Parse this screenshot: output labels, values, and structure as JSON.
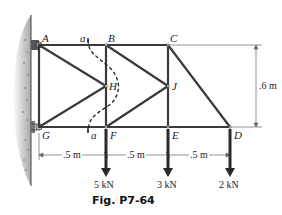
{
  "figure": {
    "caption": "Fig. P7-64",
    "joints": {
      "A": "A",
      "B": "B",
      "C": "C",
      "D": "D",
      "E": "E",
      "F": "F",
      "G": "G",
      "H": "H",
      "J": "J"
    },
    "section": {
      "top_label": "a",
      "bottom_label": "a"
    },
    "dimensions": {
      "height": ".6 m",
      "spans": [
        ".5 m",
        ".5 m",
        ".5 m"
      ]
    },
    "loads": [
      {
        "joint": "F",
        "label": "5 kN"
      },
      {
        "joint": "E",
        "label": "3 kN"
      },
      {
        "joint": "D",
        "label": "2 kN"
      }
    ],
    "colors": {
      "member": "#3a3a3a",
      "wall": "#9a9a9a",
      "text": "#222222"
    }
  }
}
